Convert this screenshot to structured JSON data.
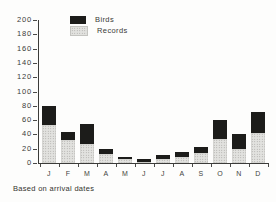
{
  "figure": {
    "caption": "Based on arrival dates"
  },
  "legend": {
    "items": [
      {
        "label": "Birds",
        "color": "#1c1c1a",
        "pattern": "solid-black"
      },
      {
        "label": "Records",
        "color": "#e2e2df",
        "pattern": "stippled-gray"
      }
    ]
  },
  "chart_data": {
    "type": "bar",
    "stacked": true,
    "title": "",
    "xlabel": "",
    "ylabel": "",
    "categories": [
      "J",
      "F",
      "M",
      "A",
      "M",
      "J",
      "J",
      "A",
      "S",
      "O",
      "N",
      "D"
    ],
    "series": [
      {
        "name": "Records",
        "values": [
          53,
          32,
          27,
          13,
          6,
          2,
          6,
          9,
          14,
          34,
          20,
          42
        ]
      },
      {
        "name": "Birds",
        "values": [
          27,
          12,
          28,
          7,
          3,
          3,
          5,
          6,
          8,
          26,
          20,
          30
        ]
      }
    ],
    "totals": [
      80,
      44,
      55,
      20,
      9,
      5,
      11,
      15,
      22,
      60,
      40,
      72
    ],
    "ylim": [
      0,
      200
    ],
    "ytick_step": 20,
    "grid": false,
    "legend_position": "upper-left-inside",
    "caption": "Based on arrival dates"
  }
}
